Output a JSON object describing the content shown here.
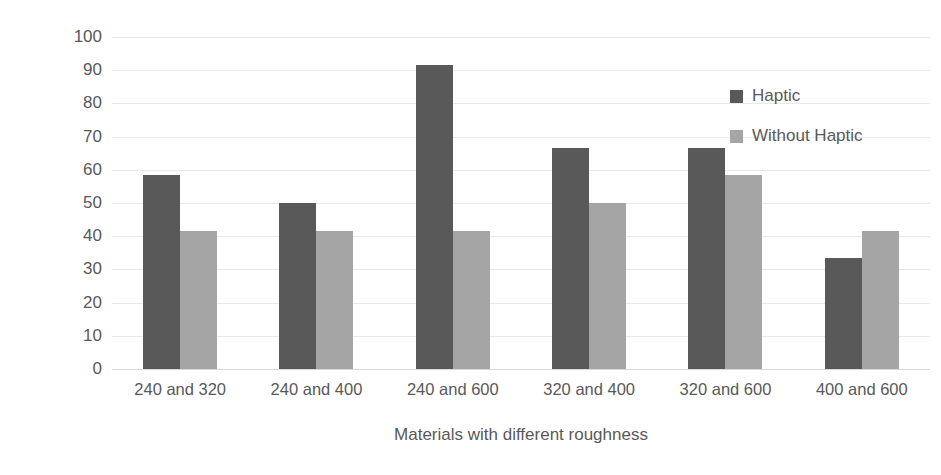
{
  "chart_data": {
    "type": "bar",
    "title": "",
    "subtitle": "",
    "xlabel": "Materials with different roughness",
    "ylabel": "Correct answer rate [%]",
    "categories": [
      "240 and 320",
      "240 and 400",
      "240 and 600",
      "320 and 400",
      "320 and 600",
      "400 and 600"
    ],
    "series": [
      {
        "name": "Haptic",
        "color": "#595959",
        "values": [
          58.3,
          50.0,
          91.7,
          66.7,
          66.7,
          33.3
        ]
      },
      {
        "name": "Without Haptic",
        "color": "#a5a5a5",
        "values": [
          41.7,
          41.7,
          41.7,
          50.0,
          58.3,
          41.7
        ]
      }
    ],
    "ylim": [
      0,
      100
    ],
    "ytick_step": 10,
    "yticks": [
      "0",
      "10",
      "20",
      "30",
      "40",
      "50",
      "60",
      "70",
      "80",
      "90",
      "100"
    ],
    "grid": true,
    "grid_axis": "y",
    "grid_color": "#e9e9e9",
    "legend_position": "upper right",
    "background_color": "#ffffff",
    "text_color": "#595959"
  }
}
